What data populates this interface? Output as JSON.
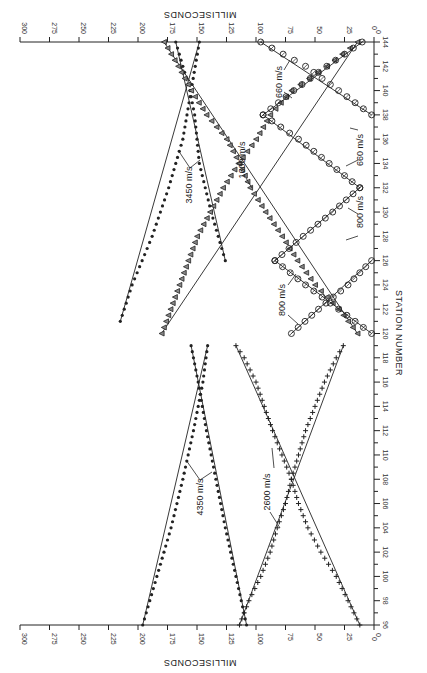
{
  "chart_data": {
    "type": "scatter",
    "title": "",
    "orientation": "rotated 90° (station axis vertical on right, time axis horizontal, increasing leftward)",
    "xlabel": "STATION NUMBER",
    "ylabel": "MILLISECONDS",
    "station_axis": {
      "range": [
        96,
        144
      ],
      "ticks": [
        96,
        98,
        100,
        102,
        104,
        106,
        108,
        110,
        112,
        114,
        116,
        118,
        120,
        122,
        124,
        126,
        128,
        130,
        132,
        134,
        136,
        138,
        140,
        142,
        144
      ]
    },
    "time_axis": {
      "range": [
        0,
        300
      ],
      "ticks": [
        0,
        25,
        50,
        75,
        100,
        125,
        150,
        175,
        200,
        225,
        250,
        275,
        300
      ],
      "grid": false
    },
    "panels": [
      {
        "name": "lower",
        "station_range": [
          96,
          119
        ],
        "series": [
          {
            "name": "4350 m/s forward",
            "marker": "dot",
            "points": [
              [
                96,
                196
              ],
              [
                100,
                184
              ],
              [
                104,
                172
              ],
              [
                108,
                162
              ],
              [
                112,
                153
              ],
              [
                116,
                145
              ],
              [
                119,
                141
              ]
            ]
          },
          {
            "name": "4350 m/s reverse",
            "marker": "dot",
            "points": [
              [
                96,
                108
              ],
              [
                100,
                117
              ],
              [
                104,
                126
              ],
              [
                108,
                134
              ],
              [
                112,
                142
              ],
              [
                116,
                149
              ],
              [
                119,
                155
              ]
            ]
          },
          {
            "name": "2600 m/s forward",
            "marker": "plus",
            "points": [
              [
                96,
                114
              ],
              [
                98,
                106
              ],
              [
                100,
                96
              ],
              [
                102,
                88
              ],
              [
                104,
                82
              ],
              [
                106,
                75
              ],
              [
                108,
                70
              ],
              [
                110,
                64
              ],
              [
                112,
                58
              ],
              [
                114,
                50
              ],
              [
                116,
                42
              ],
              [
                118,
                32
              ],
              [
                119,
                26
              ]
            ]
          },
          {
            "name": "2600 m/s reverse",
            "marker": "plus",
            "points": [
              [
                96,
                12
              ],
              [
                98,
                22
              ],
              [
                100,
                32
              ],
              [
                102,
                45
              ],
              [
                104,
                56
              ],
              [
                106,
                64
              ],
              [
                108,
                70
              ],
              [
                110,
                78
              ],
              [
                112,
                86
              ],
              [
                114,
                93
              ],
              [
                116,
                100
              ],
              [
                118,
                110
              ],
              [
                119,
                117
              ]
            ]
          }
        ],
        "annotations": [
          "4350 m/s",
          "2600 m/s"
        ]
      },
      {
        "name": "upper",
        "station_range": [
          120,
          144
        ],
        "series": [
          {
            "name": "3450 m/s forward",
            "marker": "dot",
            "points": [
              [
                121,
                215
              ],
              [
                124,
                205
              ],
              [
                128,
                188
              ],
              [
                132,
                174
              ],
              [
                136,
                162
              ],
              [
                140,
                155
              ],
              [
                144,
                148
              ]
            ]
          },
          {
            "name": "3450 m/s reverse",
            "marker": "dot",
            "points": [
              [
                126,
                126
              ],
              [
                130,
                138
              ],
              [
                134,
                148
              ],
              [
                138,
                152
              ],
              [
                140,
                156
              ],
              [
                144,
                168
              ]
            ]
          },
          {
            "name": "1600 m/s forward",
            "marker": "triangle",
            "points": [
              [
                120,
                180
              ],
              [
                124,
                165
              ],
              [
                128,
                150
              ],
              [
                132,
                128
              ],
              [
                134,
                115
              ],
              [
                136,
                100
              ],
              [
                138,
                88
              ],
              [
                140,
                70
              ],
              [
                142,
                40
              ],
              [
                144,
                14
              ]
            ]
          },
          {
            "name": "1600 m/s reverse",
            "marker": "triangle",
            "points": [
              [
                120,
                14
              ],
              [
                122,
                30
              ],
              [
                124,
                50
              ],
              [
                126,
                65
              ],
              [
                128,
                78
              ],
              [
                130,
                92
              ],
              [
                132,
                105
              ],
              [
                134,
                114
              ],
              [
                136,
                125
              ],
              [
                138,
                142
              ],
              [
                140,
                155
              ],
              [
                142,
                166
              ],
              [
                144,
                178
              ]
            ]
          },
          {
            "name": "800 m/s set A",
            "marker": "circle",
            "points": [
              [
                120,
                70
              ],
              [
                122,
                47
              ],
              [
                124,
                22
              ],
              [
                126,
                2
              ]
            ]
          },
          {
            "name": "800 m/s set B",
            "marker": "circle",
            "points": [
              [
                120,
                2
              ],
              [
                122,
                30
              ],
              [
                124,
                58
              ],
              [
                126,
                84
              ]
            ]
          },
          {
            "name": "800 m/s set C",
            "marker": "circle",
            "points": [
              [
                126,
                84
              ],
              [
                128,
                60
              ],
              [
                130,
                35
              ],
              [
                132,
                12
              ]
            ]
          },
          {
            "name": "660 m/s set A",
            "marker": "circle",
            "points": [
              [
                132,
                12
              ],
              [
                134,
                38
              ],
              [
                136,
                64
              ],
              [
                138,
                94
              ]
            ]
          },
          {
            "name": "660 m/s set B",
            "marker": "circle",
            "points": [
              [
                138,
                94
              ],
              [
                140,
                68
              ],
              [
                142,
                40
              ],
              [
                144,
                10
              ]
            ]
          },
          {
            "name": "660 m/s set C",
            "marker": "circle",
            "points": [
              [
                138,
                2
              ],
              [
                140,
                30
              ],
              [
                142,
                58
              ],
              [
                144,
                96
              ]
            ]
          }
        ],
        "annotations": [
          "3450 m/s",
          "1600 m/s",
          "800 m/s",
          "800 m/s",
          "660 m/s",
          "660 m/s"
        ]
      }
    ],
    "legend": "none (velocity annotations inline)"
  },
  "labels": {
    "top_axis_title": "MILLISECONDS",
    "bottom_axis_title": "MILLISECONDS",
    "station_axis_title": "STATION NUMBER",
    "vel_4350": "4350 m/s",
    "vel_2600": "2600 m/s",
    "vel_3450": "3450 m/s",
    "vel_1600": "1600 m/s",
    "vel_800a": "800 m/s",
    "vel_800b": "800 m/s",
    "vel_660a": "660 m/s",
    "vel_660b": "660 m/s"
  }
}
